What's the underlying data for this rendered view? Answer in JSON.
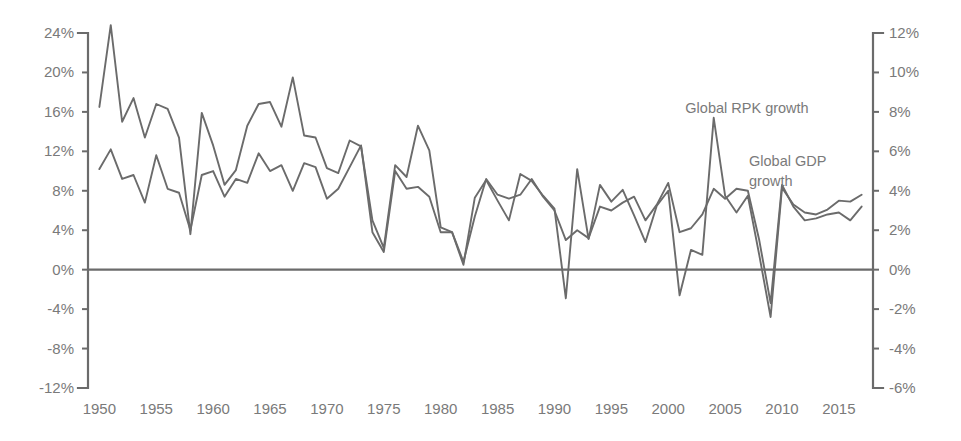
{
  "chart_data": {
    "type": "line",
    "title": "",
    "subtitle": "",
    "xlabel": "",
    "ylabel": "",
    "grid": false,
    "legend_position": "inline-annotation",
    "x": [
      1950,
      1951,
      1952,
      1953,
      1954,
      1955,
      1956,
      1957,
      1958,
      1959,
      1960,
      1961,
      1962,
      1963,
      1964,
      1965,
      1966,
      1967,
      1968,
      1969,
      1970,
      1971,
      1972,
      1973,
      1974,
      1975,
      1976,
      1977,
      1978,
      1979,
      1980,
      1981,
      1982,
      1983,
      1984,
      1985,
      1986,
      1987,
      1988,
      1989,
      1990,
      1991,
      1992,
      1993,
      1994,
      1995,
      1996,
      1997,
      1998,
      1999,
      2000,
      2001,
      2002,
      2003,
      2004,
      2005,
      2006,
      2007,
      2008,
      2009,
      2010,
      2011,
      2012,
      2013,
      2014,
      2015,
      2016,
      2017
    ],
    "axes": {
      "left": {
        "name": "Global RPK growth",
        "ticks": [
          "24%",
          "20%",
          "16%",
          "12%",
          "8%",
          "4%",
          "0%",
          "-4%",
          "-8%",
          "-12%"
        ],
        "tick_values": [
          24,
          20,
          16,
          12,
          8,
          4,
          0,
          -4,
          -8,
          -12
        ],
        "ylim": [
          -12,
          24
        ],
        "position": "left"
      },
      "right": {
        "name": "Global GDP growth",
        "ticks": [
          "12%",
          "10%",
          "8%",
          "6%",
          "4%",
          "2%",
          "0%",
          "-2%",
          "-4%",
          "-6%"
        ],
        "tick_values": [
          12,
          10,
          8,
          6,
          4,
          2,
          0,
          -2,
          -4,
          -6
        ],
        "ylim": [
          -6,
          12
        ],
        "position": "right"
      },
      "bottom": {
        "ticks": [
          "1950",
          "1955",
          "1960",
          "1965",
          "1970",
          "1975",
          "1980",
          "1985",
          "1990",
          "1995",
          "2000",
          "2005",
          "2010",
          "2015"
        ],
        "tick_values": [
          1950,
          1955,
          1960,
          1965,
          1970,
          1975,
          1980,
          1985,
          1990,
          1995,
          2000,
          2005,
          2010,
          2015
        ],
        "xlim": [
          1949,
          2018
        ]
      }
    },
    "series": [
      {
        "name": "Global RPK growth",
        "axis": "left",
        "color": "#6b6b6b",
        "label_text": "Global RPK growth",
        "values": [
          16.5,
          24.8,
          15.0,
          17.4,
          13.4,
          16.8,
          16.3,
          13.4,
          3.6,
          15.9,
          12.6,
          8.6,
          10.1,
          14.6,
          16.8,
          17.0,
          14.5,
          19.5,
          13.6,
          13.4,
          10.3,
          9.8,
          13.1,
          12.5,
          5.0,
          2.2,
          10.6,
          9.4,
          14.6,
          12.1,
          4.3,
          3.8,
          0.5,
          7.3,
          9.1,
          7.0,
          5.0,
          9.7,
          9.0,
          7.5,
          6.2,
          -2.9,
          10.2,
          3.1,
          8.6,
          6.9,
          8.1,
          5.5,
          2.8,
          6.5,
          8.0,
          -2.6,
          2.0,
          1.5,
          15.4,
          7.5,
          5.8,
          7.5,
          1.5,
          -4.8,
          8.3,
          6.6,
          5.8,
          5.6,
          6.1,
          7.0,
          6.9,
          7.6
        ]
      },
      {
        "name": "Global GDP growth",
        "axis": "right",
        "color": "#6b6b6b",
        "label_text": "Global GDP growth",
        "values": [
          5.1,
          6.1,
          4.6,
          4.8,
          3.4,
          5.8,
          4.1,
          3.9,
          2.0,
          4.8,
          5.0,
          3.7,
          4.6,
          4.4,
          5.9,
          5.0,
          5.3,
          4.0,
          5.4,
          5.2,
          3.6,
          4.1,
          5.2,
          6.3,
          1.9,
          0.9,
          5.0,
          4.1,
          4.2,
          3.7,
          1.9,
          1.9,
          0.4,
          2.7,
          4.6,
          3.8,
          3.6,
          3.8,
          4.6,
          3.7,
          3.0,
          1.5,
          2.0,
          1.6,
          3.2,
          3.0,
          3.4,
          3.7,
          2.5,
          3.3,
          4.4,
          1.9,
          2.1,
          2.8,
          4.1,
          3.6,
          4.1,
          4.0,
          1.5,
          -1.7,
          4.3,
          3.2,
          2.5,
          2.6,
          2.8,
          2.9,
          2.5,
          3.2
        ]
      }
    ],
    "annotations": [
      {
        "text": "Global RPK growth",
        "x": 2000,
        "align": "center",
        "note": "label above 2000 RPK peak"
      },
      {
        "text": "Global GDP growth",
        "x": 2006,
        "align": "left",
        "note": "two-line label right of centre"
      }
    ]
  }
}
